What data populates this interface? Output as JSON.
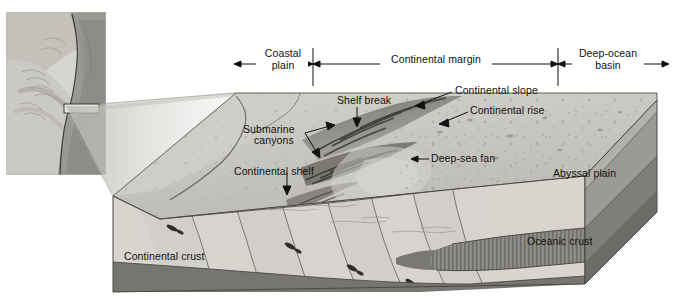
{
  "figure": {
    "type": "geological-block-diagram",
    "background_color": "#ffffff",
    "line_color": "#111111"
  },
  "scale_bar": {
    "segments": [
      {
        "label": "Coastal\nplain",
        "label_line1": "Coastal",
        "label_line2": "plain",
        "x_start": 234,
        "x_end": 313
      },
      {
        "label": "Continental margin",
        "label_line1": "Continental margin",
        "label_line2": "",
        "x_start": 313,
        "x_end": 558
      },
      {
        "label": "Deep-ocean\nbasin",
        "label_line1": "Deep-ocean",
        "label_line2": "basin",
        "x_start": 558,
        "x_end": 669
      }
    ],
    "tick_x": [
      313,
      558
    ],
    "tick_top": 48,
    "tick_bottom": 86,
    "rule_y": 64
  },
  "labels": [
    {
      "id": "shelf-break",
      "text": "Shelf break",
      "x": 337,
      "y": 96,
      "align": "left"
    },
    {
      "id": "continental-slope",
      "text": "Continental slope",
      "x": 455,
      "y": 86,
      "align": "left"
    },
    {
      "id": "continental-rise",
      "text": "Continental rise",
      "x": 470,
      "y": 106,
      "align": "left"
    },
    {
      "id": "submarine-canyons-line1",
      "text": "Submarine",
      "x": 243,
      "y": 126,
      "align": "left"
    },
    {
      "id": "submarine-canyons-line2",
      "text": "canyons",
      "x": 254,
      "y": 137,
      "align": "left"
    },
    {
      "id": "deep-sea-fan",
      "text": "Deep-sea fan",
      "x": 431,
      "y": 156,
      "align": "left"
    },
    {
      "id": "continental-shelf",
      "text": "Continental shelf",
      "x": 234,
      "y": 168,
      "align": "left"
    },
    {
      "id": "abyssal-plain",
      "text": "Abyssal plain",
      "x": 553,
      "y": 170,
      "align": "left"
    },
    {
      "id": "continental-crust",
      "text": "Continental crust",
      "x": 124,
      "y": 253,
      "align": "left"
    },
    {
      "id": "oceanic-crust",
      "text": "Oceanic crust",
      "x": 527,
      "y": 238,
      "align": "left"
    }
  ],
  "leaders": [
    {
      "id": "shelf-break-leader",
      "points": "357,108 357,124"
    },
    {
      "id": "continental-slope-leader",
      "points": "452,92 418,105"
    },
    {
      "id": "continental-rise-leader",
      "points": "467,112 443,123"
    },
    {
      "id": "submarine-canyon-leader-a",
      "points": "308,132 329,126"
    },
    {
      "id": "submarine-canyon-leader-b",
      "points": "308,132 318,155"
    },
    {
      "id": "deep-sea-fan-leader",
      "points": "428,159 414,159"
    },
    {
      "id": "continental-shelf-leader",
      "points": "287,174 287,194"
    }
  ],
  "inset_map": {
    "name": "regional-relief-map",
    "x": 6,
    "y": 12,
    "width": 100,
    "height": 163,
    "highlight_box": {
      "x": 64,
      "y": 104,
      "width": 35,
      "height": 9
    },
    "description": "Grayscale shaded-relief map of an eastern continental margin with coastline"
  },
  "block": {
    "top_surface_color": "#c8c6c0",
    "front_face_color": "#d8d5cf",
    "side_face_color": "#9c9a94",
    "oceanic_crust_color": "#8e8c86",
    "mantle_color": "#77756f"
  }
}
